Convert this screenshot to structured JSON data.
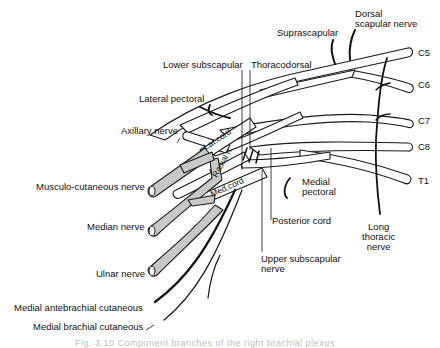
{
  "diagram": {
    "subject": "Brachial plexus",
    "colors": {
      "outline": "#1a1a1a",
      "gray_fill": "#c8c8c8",
      "white_fill": "#ffffff"
    },
    "roots": [
      {
        "label": "C5"
      },
      {
        "label": "C6"
      },
      {
        "label": "C7"
      },
      {
        "label": "C8"
      },
      {
        "label": "T1"
      }
    ],
    "cord_labels": {
      "lateral": "Lat.cord",
      "medial": "Med.cord",
      "radial": "Radial n."
    },
    "labels": {
      "dorsal_scapular": "Dorsal\nscapular nerve",
      "suprascapular": "Suprascapular",
      "lower_subscapular": "Lower subscapular",
      "thoracodorsal": "Thoracodorsal",
      "lateral_pectoral": "Lateral pectoral",
      "axillary": "Axillary nerve",
      "musculocutaneous": "Musculo-cutaneous nerve",
      "median": "Median nerve",
      "ulnar": "Ulnar nerve",
      "medial_antebrachial": "Medial antebrachial cutaneous",
      "medial_brachial": "Medial brachial cutaneous",
      "medial_pectoral": "Medial\npectoral",
      "posterior_cord": "Posterior cord",
      "upper_subscapular": "Upper subscapular\nnerve",
      "long_thoracic": "Long\nthoracic\nnerve"
    },
    "caption": "Fig. 3.10  Component branches of the right brachial plexus"
  }
}
